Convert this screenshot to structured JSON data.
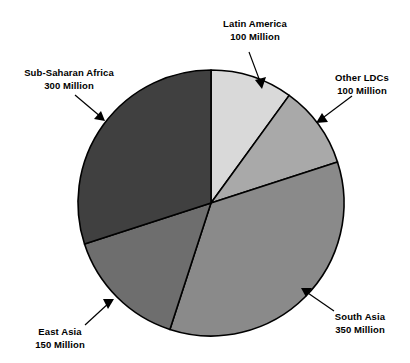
{
  "chart_data": {
    "type": "pie",
    "title": "",
    "subtitle": "",
    "xlabel": "",
    "ylabel": "",
    "units": "Million",
    "total": 1000,
    "legend_position": "none",
    "grid": false,
    "start_angle_deg": 0,
    "direction": "clockwise",
    "categories": [
      "Latin America",
      "Other LDCs",
      "South Asia",
      "East Asia",
      "Sub-Saharan Africa"
    ],
    "values": [
      100,
      100,
      350,
      150,
      300
    ],
    "value_labels": [
      "100 Million",
      "100 Million",
      "350 Million",
      "150 Million",
      "300 Million"
    ],
    "colors": [
      "#d9d9d9",
      "#a9a9a9",
      "#8a8a8a",
      "#6e6e6e",
      "#404040"
    ],
    "slices": [
      {
        "name": "Latin America",
        "value": 100,
        "value_label": "100 Million",
        "percent": 10,
        "start_deg": 0,
        "end_deg": 36,
        "color": "#d9d9d9"
      },
      {
        "name": "Other LDCs",
        "value": 100,
        "value_label": "100 Million",
        "percent": 10,
        "start_deg": 36,
        "end_deg": 72,
        "color": "#a9a9a9"
      },
      {
        "name": "South Asia",
        "value": 350,
        "value_label": "350 Million",
        "percent": 35,
        "start_deg": 72,
        "end_deg": 198,
        "color": "#8a8a8a"
      },
      {
        "name": "East Asia",
        "value": 150,
        "value_label": "150 Million",
        "percent": 15,
        "start_deg": 198,
        "end_deg": 252,
        "color": "#6e6e6e"
      },
      {
        "name": "Sub-Saharan Africa",
        "value": 300,
        "value_label": "300 Million",
        "percent": 30,
        "start_deg": 252,
        "end_deg": 360,
        "color": "#404040"
      }
    ]
  },
  "labels": {
    "latin_america": {
      "name": "Latin America",
      "value": "100 Million"
    },
    "other_ldcs": {
      "name": "Other LDCs",
      "value": "100 Million"
    },
    "south_asia": {
      "name": "South Asia",
      "value": "350 Million"
    },
    "east_asia": {
      "name": "East Asia",
      "value": "150 Million"
    },
    "sub_saharan_africa": {
      "name": "Sub-Saharan Africa",
      "value": "300 Million"
    }
  }
}
